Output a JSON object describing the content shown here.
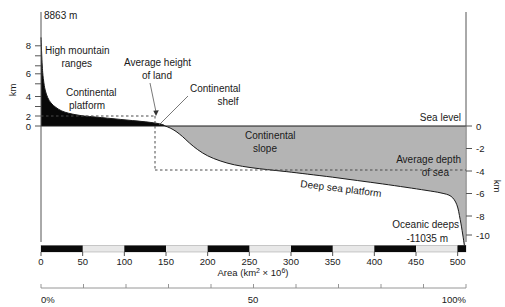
{
  "chart_data": {
    "type": "area",
    "xlabel": "Area (km² × 10⁶)",
    "ylabel_left": "km",
    "ylabel_right": "km",
    "xlim": [
      0,
      510
    ],
    "ylim_left": [
      0,
      9
    ],
    "ylim_right": [
      -11,
      0
    ],
    "grid": false,
    "legend": "none",
    "x_ticks": [
      0,
      50,
      100,
      150,
      200,
      250,
      300,
      350,
      400,
      450,
      500
    ],
    "x_tick_labels": [
      "0",
      "50",
      "100",
      "150",
      "200",
      "250",
      "300",
      "350",
      "400",
      "450",
      "500"
    ],
    "y_ticks_left": [
      0,
      2,
      4,
      6,
      8
    ],
    "y_tick_labels_left": [
      "0",
      "2",
      "4",
      "6",
      "8"
    ],
    "y_ticks_right": [
      0,
      -2,
      -4,
      -6,
      -8,
      -10
    ],
    "y_tick_labels_right": [
      "0",
      "-2",
      "-4",
      "-6",
      "-8",
      "-10"
    ],
    "pct_ticks": [
      0,
      50,
      100
    ],
    "pct_tick_labels": [
      "0%",
      "50",
      "100%"
    ],
    "max_elevation_m": 8863,
    "max_elevation_label": "8863 m",
    "min_elevation_m": -11035,
    "min_elevation_label": "-11035 m",
    "average_height_of_land_km": 0.84,
    "average_depth_of_sea_km": -3.8,
    "land_sea_boundary_x": 149,
    "curve_points": [
      [
        0,
        8.863
      ],
      [
        1.5,
        6.0
      ],
      [
        3,
        4.6
      ],
      [
        5,
        3.6
      ],
      [
        8,
        2.85
      ],
      [
        12,
        2.3
      ],
      [
        18,
        1.85
      ],
      [
        25,
        1.5
      ],
      [
        33,
        1.28
      ],
      [
        42,
        1.12
      ],
      [
        52,
        1.0
      ],
      [
        65,
        0.9
      ],
      [
        80,
        0.78
      ],
      [
        95,
        0.66
      ],
      [
        110,
        0.54
      ],
      [
        125,
        0.42
      ],
      [
        138,
        0.28
      ],
      [
        146,
        0.14
      ],
      [
        149,
        0.0
      ],
      [
        155,
        -0.18
      ],
      [
        162,
        -0.48
      ],
      [
        170,
        -0.95
      ],
      [
        178,
        -1.5
      ],
      [
        188,
        -2.1
      ],
      [
        200,
        -2.65
      ],
      [
        215,
        -3.1
      ],
      [
        232,
        -3.45
      ],
      [
        252,
        -3.7
      ],
      [
        272,
        -3.88
      ],
      [
        295,
        -4.06
      ],
      [
        320,
        -4.28
      ],
      [
        350,
        -4.55
      ],
      [
        380,
        -4.85
      ],
      [
        410,
        -5.15
      ],
      [
        438,
        -5.45
      ],
      [
        462,
        -5.72
      ],
      [
        480,
        -5.95
      ],
      [
        492,
        -6.25
      ],
      [
        499,
        -7.0
      ],
      [
        503,
        -8.3
      ],
      [
        506,
        -9.6
      ],
      [
        508,
        -10.6
      ],
      [
        509,
        -11.035
      ]
    ]
  },
  "annotations": {
    "peak_label": "8863 m",
    "high_mountain_ranges": "High mountain\nranges",
    "high_mountain_line1": "High mountain",
    "high_mountain_line2": "ranges",
    "continental_platform_line1": "Continental",
    "continental_platform_line2": "platform",
    "average_height_line1": "Average height",
    "average_height_line2": "of land",
    "continental_shelf_line1": "Continental",
    "continental_shelf_line2": "shelf",
    "continental_slope_line1": "Continental",
    "continental_slope_line2": "slope",
    "sea_level": "Sea level",
    "average_depth_line1": "Average depth",
    "average_depth_line2": "of sea",
    "deep_sea_platform": "Deep sea platform",
    "oceanic_deeps": "Oceanic deeps",
    "deepest_label": "-11035 m"
  },
  "axes": {
    "x_title": "Area (km² × 10⁶)",
    "x_title_main": "Area (km",
    "x_title_sup1": "2",
    "x_title_mid": " × 10",
    "x_title_sup2": "6",
    "x_title_end": ")",
    "left_axis_name": "km",
    "right_axis_name": "km",
    "left_ticks": [
      "8",
      "6",
      "4",
      "2",
      "0"
    ],
    "right_ticks": [
      "0",
      "-2",
      "-4",
      "-6",
      "-8",
      "-10"
    ],
    "x_ticks": [
      "0",
      "50",
      "100",
      "150",
      "200",
      "250",
      "300",
      "350",
      "400",
      "450",
      "500"
    ],
    "pct_ticks": [
      "0%",
      "50",
      "100%"
    ]
  },
  "colors": {
    "land_fill": "#080808",
    "sea_fill": "#b4b4b4",
    "curve_stroke": "#1a1a1a",
    "axis": "#555555",
    "text": "#1a1a1a",
    "scalebar_black": "#0a0a0a",
    "scalebar_white": "#e8e8e8"
  }
}
